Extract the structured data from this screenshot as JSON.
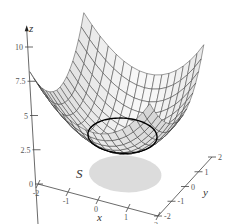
{
  "chart_data": {
    "type": "surface3d",
    "title": "",
    "surface": {
      "equation": "z = x^2 + y^2 + 2",
      "x_range": [
        -2,
        2
      ],
      "y_range": [
        -2,
        2
      ],
      "grid_lines": 16,
      "fill_color": "#f2f2f2",
      "mesh_color": "#2a2a2a"
    },
    "curve": {
      "description": "boundary curve of surface over region S (intersection with cylinder x^2+y^2=1)",
      "color": "#000000"
    },
    "region": {
      "label": "S",
      "shape": "disk x^2 + y^2 <= 1 in xy-plane",
      "fill_color": "#dcdcdc"
    },
    "axes": {
      "x": {
        "label": "x",
        "ticks": [
          "-2",
          "-1",
          "0",
          "1",
          "2"
        ],
        "range": [
          -2,
          2
        ]
      },
      "y": {
        "label": "y",
        "ticks": [
          "-2",
          "-1",
          "0",
          "1",
          "2"
        ],
        "range": [
          -2,
          2
        ]
      },
      "z": {
        "label": "z",
        "ticks": [
          "0",
          "2.5",
          "5",
          "7.5",
          "10"
        ],
        "range": [
          0,
          10
        ]
      }
    }
  }
}
